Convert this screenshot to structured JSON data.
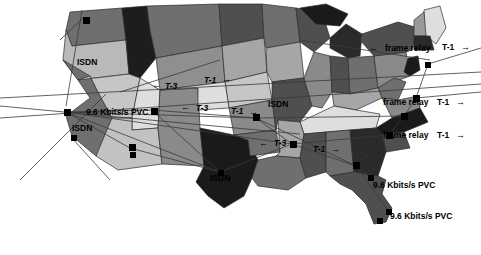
{
  "figure": {
    "kind": "network-topology-map",
    "region": "United States",
    "background_color": "#ffffff",
    "line_color": "#3a3a3a",
    "marker_color": "#000000"
  },
  "palette": {
    "very_dark": "#1a1a1a",
    "dark": "#4d4d4d",
    "mid": "#777777",
    "mid_light": "#9a9a9a",
    "light": "#c2c2c2",
    "very_light": "#e2e2e2",
    "white": "#f5f5f5"
  },
  "labels": [
    {
      "id": "isdn-seattle",
      "text": "ISDN",
      "x": 77,
      "y": 58,
      "size": "md",
      "italic": false
    },
    {
      "id": "isdn-sanfran",
      "text": "ISDN",
      "x": 72,
      "y": 124,
      "size": "md",
      "italic": false
    },
    {
      "id": "pvc-west",
      "text": "9.6 Kbits/s PVC",
      "x": 86,
      "y": 108,
      "size": "md",
      "italic": false
    },
    {
      "id": "t3-north",
      "text": "T-3",
      "x": 165,
      "y": 82,
      "size": "md",
      "italic": true
    },
    {
      "id": "t1-north",
      "text": "T-1",
      "x": 204,
      "y": 76,
      "size": "md",
      "italic": true
    },
    {
      "id": "t3-mid",
      "text": "T-3",
      "x": 196,
      "y": 104,
      "size": "md",
      "italic": true
    },
    {
      "id": "t1-mid",
      "text": "T-1",
      "x": 231,
      "y": 107,
      "size": "md",
      "italic": true
    },
    {
      "id": "t3-south",
      "text": "T-3",
      "x": 274,
      "y": 139,
      "size": "md",
      "italic": true
    },
    {
      "id": "t1-south",
      "text": "T-1",
      "x": 313,
      "y": 145,
      "size": "md",
      "italic": true
    },
    {
      "id": "isdn-midwest",
      "text": "ISDN",
      "x": 268,
      "y": 100,
      "size": "md",
      "italic": false
    },
    {
      "id": "isdn-texas",
      "text": "ISDN",
      "x": 210,
      "y": 174,
      "size": "md",
      "italic": false
    },
    {
      "id": "framerelay-ne",
      "text": "frame relay",
      "x": 385,
      "y": 44,
      "size": "md",
      "italic": false
    },
    {
      "id": "t1-ne",
      "text": "T-1",
      "x": 442,
      "y": 43,
      "size": "md",
      "italic": false
    },
    {
      "id": "framerelay-mid",
      "text": "frame relay",
      "x": 383,
      "y": 98,
      "size": "md",
      "italic": false
    },
    {
      "id": "t1-midatlantic",
      "text": "T-1",
      "x": 437,
      "y": 98,
      "size": "md",
      "italic": false
    },
    {
      "id": "framerelay-se",
      "text": "frame relay",
      "x": 383,
      "y": 131,
      "size": "md",
      "italic": false
    },
    {
      "id": "t1-se",
      "text": "T-1",
      "x": 437,
      "y": 131,
      "size": "md",
      "italic": false
    },
    {
      "id": "pvc-southeast",
      "text": "9.6 Kbits/s PVC",
      "x": 373,
      "y": 181,
      "size": "md",
      "italic": false
    },
    {
      "id": "pvc-florida",
      "text": "9.6 Kbits/s PVC",
      "x": 390,
      "y": 212,
      "size": "md",
      "italic": false
    }
  ],
  "arrows": [
    {
      "id": "arrow-t3-north-left",
      "glyph": "←",
      "x": 152,
      "y": 81
    },
    {
      "id": "arrow-t1-north-right",
      "glyph": "→",
      "x": 222,
      "y": 75
    },
    {
      "id": "arrow-t3-mid-left",
      "glyph": "←",
      "x": 181,
      "y": 103
    },
    {
      "id": "arrow-t1-mid-right",
      "glyph": "→",
      "x": 249,
      "y": 108
    },
    {
      "id": "arrow-t3-south-left",
      "glyph": "←",
      "x": 259,
      "y": 139
    },
    {
      "id": "arrow-t1-south-right",
      "glyph": "→",
      "x": 331,
      "y": 145
    },
    {
      "id": "arrow-fr-ne-left",
      "glyph": "←",
      "x": 369,
      "y": 44
    },
    {
      "id": "arrow-t1-ne-right",
      "glyph": "→",
      "x": 461,
      "y": 43
    },
    {
      "id": "arrow-t1-mid-atl",
      "glyph": "→",
      "x": 456,
      "y": 98
    },
    {
      "id": "arrow-t1-se-right",
      "glyph": "→",
      "x": 456,
      "y": 131
    }
  ],
  "markers": [
    {
      "id": "site-seattle",
      "x": 83,
      "y": 17,
      "large": true
    },
    {
      "id": "site-sanfrancisco",
      "x": 64,
      "y": 109,
      "large": true
    },
    {
      "id": "site-losangeles",
      "x": 71,
      "y": 135,
      "large": false
    },
    {
      "id": "site-saltlake",
      "x": 129,
      "y": 144,
      "large": true
    },
    {
      "id": "site-denver",
      "x": 151,
      "y": 108,
      "large": true
    },
    {
      "id": "site-phoenix",
      "x": 130,
      "y": 152,
      "large": false
    },
    {
      "id": "site-kansascity",
      "x": 253,
      "y": 114,
      "large": true
    },
    {
      "id": "site-dallas",
      "x": 218,
      "y": 170,
      "large": false
    },
    {
      "id": "site-memphis",
      "x": 290,
      "y": 141,
      "large": true
    },
    {
      "id": "site-atlanta",
      "x": 353,
      "y": 162,
      "large": true
    },
    {
      "id": "site-charlotte",
      "x": 386,
      "y": 132,
      "large": true
    },
    {
      "id": "site-washington",
      "x": 401,
      "y": 113,
      "large": true
    },
    {
      "id": "site-newyork",
      "x": 413,
      "y": 95,
      "large": true
    },
    {
      "id": "site-boston",
      "x": 425,
      "y": 62,
      "large": false
    },
    {
      "id": "site-jacksonville",
      "x": 368,
      "y": 175,
      "large": false
    },
    {
      "id": "site-miami",
      "x": 386,
      "y": 209,
      "large": false
    },
    {
      "id": "site-tampa",
      "x": 377,
      "y": 218,
      "large": false
    }
  ]
}
